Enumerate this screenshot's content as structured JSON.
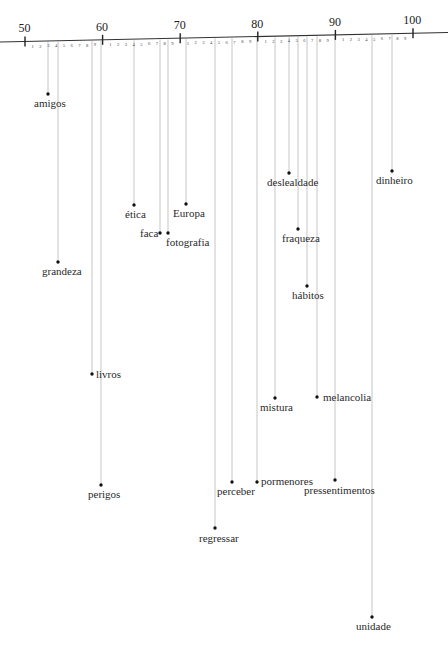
{
  "axis": {
    "start": {
      "x": 0,
      "y": 42
    },
    "end": {
      "x": 448,
      "y": 32.5
    },
    "v50_x": 25,
    "px_per_unit": 7.76,
    "major_ticks": [
      {
        "value": 50,
        "label": "50"
      },
      {
        "value": 60,
        "label": "60"
      },
      {
        "value": 70,
        "label": "70"
      },
      {
        "value": 80,
        "label": "80"
      },
      {
        "value": 90,
        "label": "90"
      },
      {
        "value": 100,
        "label": "100"
      }
    ],
    "minor_labels": [
      "1",
      "2",
      "3",
      "4",
      "5",
      "6",
      "7",
      "8",
      "9"
    ],
    "line_color": "#333333",
    "leader_color": "#b8b8b8",
    "dot_color": "#111111"
  },
  "words": [
    {
      "label": "amigos",
      "value": 53.0,
      "dot": [
        48,
        94
      ],
      "label_pos": [
        34,
        98
      ],
      "anchor": "below"
    },
    {
      "label": "grandeza",
      "value": 54.3,
      "dot": [
        58,
        262
      ],
      "label_pos": [
        42,
        266
      ],
      "anchor": "below"
    },
    {
      "label": "livros",
      "value": 58.6,
      "dot": [
        92,
        374
      ],
      "label_pos": [
        96,
        369
      ],
      "anchor": "right"
    },
    {
      "label": "perigos",
      "value": 59.8,
      "dot": [
        101,
        485
      ],
      "label_pos": [
        88,
        489
      ],
      "anchor": "below"
    },
    {
      "label": "ética",
      "value": 64.0,
      "dot": [
        134,
        205
      ],
      "label_pos": [
        125,
        209
      ],
      "anchor": "below"
    },
    {
      "label": "faca",
      "value": 67.4,
      "dot": [
        160,
        233
      ],
      "label_pos": [
        140,
        228
      ],
      "anchor": "left"
    },
    {
      "label": "fotografia",
      "value": 68.4,
      "dot": [
        168,
        233
      ],
      "label_pos": [
        166,
        237
      ],
      "anchor": "below"
    },
    {
      "label": "Europa",
      "value": 70.8,
      "dot": [
        186,
        204
      ],
      "label_pos": [
        173,
        208
      ],
      "anchor": "below"
    },
    {
      "label": "regressar",
      "value": 74.5,
      "dot": [
        215,
        528
      ],
      "label_pos": [
        199,
        533
      ],
      "anchor": "below"
    },
    {
      "label": "perceber",
      "value": 76.7,
      "dot": [
        232,
        482
      ],
      "label_pos": [
        217,
        486
      ],
      "anchor": "below"
    },
    {
      "label": "pormenores",
      "value": 79.9,
      "dot": [
        257,
        482
      ],
      "label_pos": [
        261,
        476
      ],
      "anchor": "right"
    },
    {
      "label": "mistura",
      "value": 82.2,
      "dot": [
        275,
        398
      ],
      "label_pos": [
        260,
        402
      ],
      "anchor": "below"
    },
    {
      "label": "deslealdade",
      "value": 84.0,
      "dot": [
        289,
        173
      ],
      "label_pos": [
        267,
        177
      ],
      "anchor": "below"
    },
    {
      "label": "fraqueza",
      "value": 85.2,
      "dot": [
        298,
        229
      ],
      "label_pos": [
        282,
        233
      ],
      "anchor": "below"
    },
    {
      "label": "hábitos",
      "value": 86.3,
      "dot": [
        307,
        286
      ],
      "label_pos": [
        292,
        290
      ],
      "anchor": "below"
    },
    {
      "label": "melancolia",
      "value": 87.6,
      "dot": [
        317,
        397
      ],
      "label_pos": [
        323,
        392
      ],
      "anchor": "right"
    },
    {
      "label": "pressentimentos",
      "value": 90.0,
      "dot": [
        335,
        480
      ],
      "label_pos": [
        304,
        485
      ],
      "anchor": "below"
    },
    {
      "label": "unidade",
      "value": 94.7,
      "dot": [
        372,
        617
      ],
      "label_pos": [
        356,
        621
      ],
      "anchor": "below"
    },
    {
      "label": "dinheiro",
      "value": 97.3,
      "dot": [
        392,
        171
      ],
      "label_pos": [
        376,
        175
      ],
      "anchor": "below"
    }
  ]
}
